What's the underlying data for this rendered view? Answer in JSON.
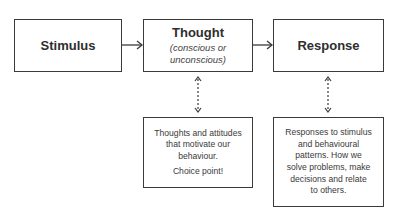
{
  "diagram": {
    "nodes": [
      {
        "id": "stimulus",
        "title": "Stimulus"
      },
      {
        "id": "thought",
        "title": "Thought",
        "subtitle_line1": "(conscious or",
        "subtitle_line2": "unconscious)"
      },
      {
        "id": "response",
        "title": "Response"
      }
    ],
    "notes": {
      "thought": {
        "lines": [
          "Thoughts and attitudes",
          "that motivate our",
          "behaviour."
        ],
        "choice": "Choice point!"
      },
      "response": {
        "lines": [
          "Responses to stimulus",
          "and behavioural",
          "patterns. How we",
          "solve problems, make",
          "decisions and relate",
          "to others."
        ]
      }
    },
    "edges": [
      {
        "from": "stimulus",
        "to": "thought",
        "style": "solid",
        "direction": "forward"
      },
      {
        "from": "thought",
        "to": "response",
        "style": "solid",
        "direction": "forward"
      },
      {
        "from": "thought",
        "to": "thought-note",
        "style": "dashed",
        "direction": "both"
      },
      {
        "from": "response",
        "to": "response-note",
        "style": "dashed",
        "direction": "both"
      }
    ],
    "colors": {
      "stroke": "#3a3a3a",
      "text": "#2e2e2e",
      "background": "#ffffff"
    }
  }
}
